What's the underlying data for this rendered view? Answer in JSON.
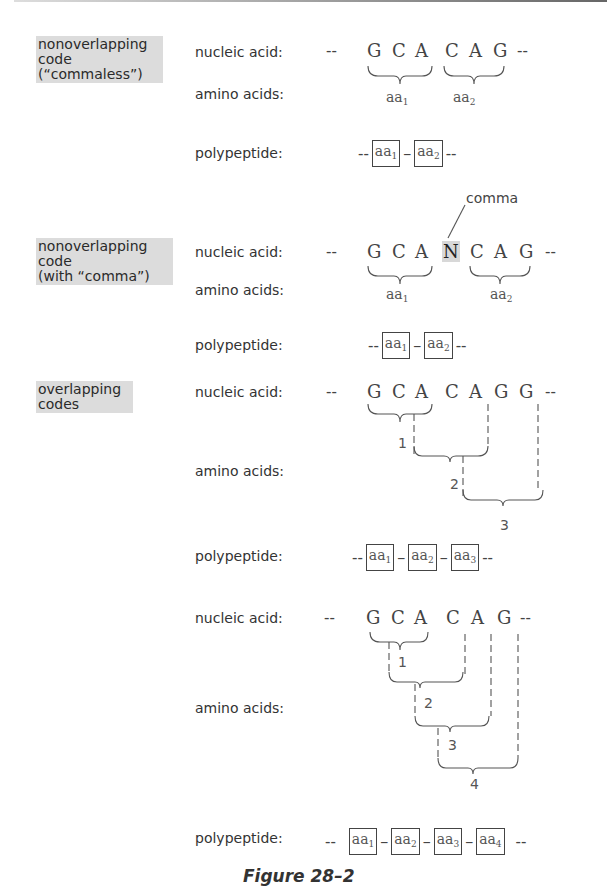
{
  "figure": {
    "caption": "Figure 28–2",
    "row_labels": {
      "nucleic": "nucleic acid:",
      "amino": "amino acids:",
      "poly": "polypeptide:"
    },
    "sections": [
      {
        "id": "nonoverlapping-commaless",
        "category_lines": [
          "nonoverlapping",
          "code",
          "(“commaless”)"
        ],
        "sequence": [
          "G",
          "C",
          "A",
          "C",
          "A",
          "G"
        ],
        "amino_acids": [
          "aa1",
          "aa2"
        ],
        "polypeptide": [
          "aa1",
          "aa2"
        ]
      },
      {
        "id": "nonoverlapping-comma",
        "category_lines": [
          "nonoverlapping",
          "code",
          "(with “comma”)"
        ],
        "comma_label": "comma",
        "sequence": [
          "G",
          "C",
          "A",
          "N",
          "C",
          "A",
          "G"
        ],
        "highlighted_base": "N",
        "amino_acids": [
          "aa1",
          "aa2"
        ],
        "polypeptide": [
          "aa1",
          "aa2"
        ]
      },
      {
        "id": "overlapping-3",
        "category_lines": [
          "overlapping",
          "codes"
        ],
        "sequence": [
          "G",
          "C",
          "A",
          "C",
          "A",
          "G",
          "G"
        ],
        "amino_acid_numbers": [
          "1",
          "2",
          "3"
        ],
        "polypeptide": [
          "aa1",
          "aa2",
          "aa3"
        ]
      },
      {
        "id": "overlapping-4",
        "sequence": [
          "G",
          "C",
          "A",
          "C",
          "A",
          "G"
        ],
        "amino_acid_numbers": [
          "1",
          "2",
          "3",
          "4"
        ],
        "polypeptide": [
          "aa1",
          "aa2",
          "aa3",
          "aa4"
        ]
      }
    ],
    "dashes": "--",
    "aa_base": "aa",
    "subscripts": [
      "1",
      "2",
      "3",
      "4"
    ]
  }
}
